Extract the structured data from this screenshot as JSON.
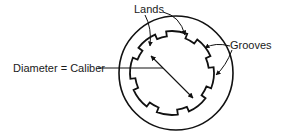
{
  "diagram": {
    "labels": {
      "lands": "Lands",
      "grooves": "Grooves",
      "diameter": "Diameter = Caliber"
    },
    "colors": {
      "stroke": "#111111",
      "text": "#1a1a1a",
      "background": "#ffffff"
    }
  }
}
